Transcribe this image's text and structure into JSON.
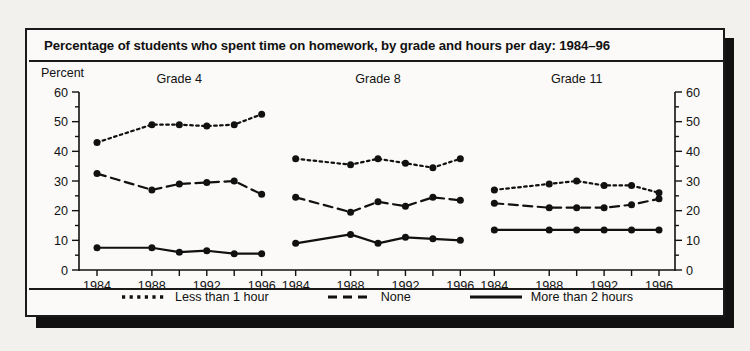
{
  "figure": {
    "title": "Percentage of students who spent time on homework, by grade and hours per day: 1984–96",
    "y_axis_label": "Percent"
  },
  "legend": {
    "items": [
      {
        "label": "Less than 1 hour",
        "style": "dotted",
        "icon": "dotted-line-swatch"
      },
      {
        "label": "None",
        "style": "dashed",
        "icon": "dashed-line-swatch"
      },
      {
        "label": "More than 2 hours",
        "style": "solid",
        "icon": "solid-line-swatch"
      }
    ]
  },
  "axis": {
    "y_ticks": [
      "0",
      "10",
      "20",
      "30",
      "40",
      "50",
      "60"
    ],
    "y_minor_step": 5,
    "x_ticks": [
      "1984",
      "1988",
      "1992",
      "1996"
    ]
  },
  "chart_data": {
    "type": "line",
    "title": "Percentage of students who spent time on homework, by grade and hours per day: 1984–96",
    "xlabel": "",
    "ylabel": "Percent",
    "ylim": [
      0,
      60
    ],
    "grid": false,
    "legend_position": "bottom",
    "panels": [
      {
        "name": "Grade 4",
        "x": [
          1984,
          1988,
          1990,
          1992,
          1994,
          1996
        ],
        "xtick_labels": [
          "1984",
          "1988",
          "1992",
          "1996"
        ],
        "xtick_values": [
          1984,
          1988,
          1992,
          1996
        ],
        "series": [
          {
            "name": "Less than 1 hour",
            "style": "dotted",
            "values": [
              43,
              49,
              49,
              48.5,
              49,
              52.5
            ]
          },
          {
            "name": "None",
            "style": "dashed",
            "values": [
              32.5,
              27,
              29,
              29.5,
              30,
              25.5
            ]
          },
          {
            "name": "More than 2 hours",
            "style": "solid",
            "values": [
              7.5,
              7.5,
              6,
              6.5,
              5.5,
              5.5
            ]
          }
        ]
      },
      {
        "name": "Grade 8",
        "x": [
          1984,
          1988,
          1990,
          1992,
          1994,
          1996
        ],
        "xtick_labels": [
          "1984",
          "1988",
          "1992",
          "1996"
        ],
        "xtick_values": [
          1984,
          1988,
          1992,
          1996
        ],
        "series": [
          {
            "name": "Less than 1 hour",
            "style": "dotted",
            "values": [
              37.5,
              35.5,
              37.5,
              36,
              34.5,
              37.5
            ]
          },
          {
            "name": "None",
            "style": "dashed",
            "values": [
              24.5,
              19.5,
              23,
              21.5,
              24.5,
              23.5
            ]
          },
          {
            "name": "More than 2 hours",
            "style": "solid",
            "values": [
              9,
              12,
              9,
              11,
              10.5,
              10
            ]
          }
        ]
      },
      {
        "name": "Grade 11",
        "x": [
          1984,
          1988,
          1990,
          1992,
          1994,
          1996
        ],
        "xtick_labels": [
          "1984",
          "1988",
          "1992",
          "1996"
        ],
        "xtick_values": [
          1984,
          1988,
          1992,
          1996
        ],
        "series": [
          {
            "name": "Less than 1 hour",
            "style": "dotted",
            "values": [
              27,
              29,
              30,
              28.5,
              28.5,
              26
            ]
          },
          {
            "name": "None",
            "style": "dashed",
            "values": [
              22.5,
              21,
              21,
              21,
              22,
              24
            ]
          },
          {
            "name": "More than 2 hours",
            "style": "solid",
            "values": [
              13.5,
              13.5,
              13.5,
              13.5,
              13.5,
              13.5
            ]
          }
        ]
      }
    ]
  },
  "colors": {
    "ink": "#111111",
    "card_bg": "#fbfaf8",
    "page_bg": "#f2f1ee",
    "shadow": "#111111"
  }
}
